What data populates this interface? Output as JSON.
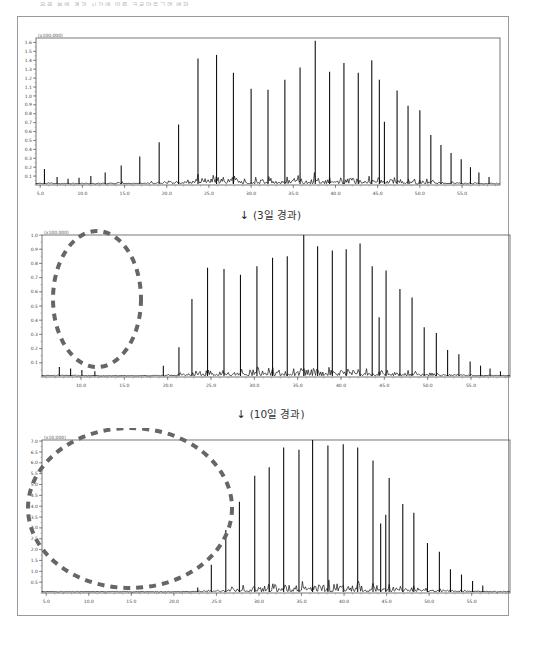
{
  "figure": {
    "top_caption": "유류 분해 경과 시간에 따른 크로마토그램 변화",
    "separators": [
      {
        "arrow_icon": "↓",
        "label": "(3일 경과)"
      },
      {
        "arrow_icon": "↓",
        "label": "(10일 경과)"
      }
    ]
  },
  "chart_data": [
    {
      "type": "line",
      "title": "",
      "xlabel": "",
      "ylabel": "",
      "y_multiplier": "(x100,000)",
      "xlim": [
        4.5,
        59.5
      ],
      "ylim": [
        0,
        1.65
      ],
      "x_ticks": [
        "5.0",
        "10.0",
        "15.0",
        "20.0",
        "25.0",
        "30.0",
        "35.0",
        "40.0",
        "45.0",
        "50.0",
        "55.0"
      ],
      "y_ticks": [
        "0.1",
        "0.2",
        "0.3",
        "0.4",
        "0.5",
        "0.6",
        "0.7",
        "0.8",
        "0.9",
        "1.0",
        "1.1",
        "1.2",
        "1.3",
        "1.4",
        "1.5",
        "1.6"
      ],
      "grid": false,
      "annotation": null,
      "peaks": {
        "x": [
          5.5,
          7.0,
          8.3,
          9.6,
          11.0,
          12.7,
          14.6,
          16.8,
          19.1,
          21.4,
          23.7,
          25.9,
          27.9,
          30.0,
          32.0,
          34.0,
          35.8,
          37.6,
          39.3,
          41.0,
          42.7,
          44.3,
          45.2,
          45.8,
          47.3,
          48.6,
          50.0,
          51.3,
          52.5,
          53.7,
          54.9,
          56.0,
          57.0,
          58.2
        ],
        "y": [
          0.18,
          0.09,
          0.07,
          0.08,
          0.1,
          0.14,
          0.22,
          0.32,
          0.48,
          0.68,
          1.42,
          1.46,
          1.26,
          1.08,
          1.07,
          1.18,
          1.32,
          1.62,
          1.27,
          1.37,
          1.26,
          1.4,
          1.18,
          0.71,
          1.06,
          0.89,
          0.84,
          0.56,
          0.45,
          0.36,
          0.29,
          0.2,
          0.14,
          0.09
        ]
      }
    },
    {
      "type": "line",
      "title": "",
      "xlabel": "",
      "ylabel": "",
      "y_multiplier": "(x100,000)",
      "xlim": [
        5.5,
        59.5
      ],
      "ylim": [
        0,
        1.0
      ],
      "x_ticks": [
        "10.0",
        "15.0",
        "20.0",
        "25.0",
        "30.0",
        "35.0",
        "40.0",
        "45.0",
        "50.0",
        "55.0"
      ],
      "y_ticks": [
        "0.1",
        "0.2",
        "0.3",
        "0.4",
        "0.5",
        "0.6",
        "0.7",
        "0.8",
        "0.9",
        "1.0"
      ],
      "grid": false,
      "annotation": "dashed ellipse marking disappearance of light fraction peaks (≈7–22 min)",
      "peaks": {
        "x": [
          7.5,
          8.8,
          10.1,
          11.6,
          19.5,
          21.3,
          22.8,
          24.6,
          26.5,
          28.4,
          30.3,
          32.1,
          33.8,
          35.7,
          37.3,
          39.0,
          40.6,
          42.2,
          43.6,
          44.4,
          45.2,
          46.8,
          48.2,
          49.6,
          51.0,
          52.3,
          53.6,
          54.9,
          56.1,
          57.2,
          58.4
        ],
        "y": [
          0.07,
          0.06,
          0.05,
          0.04,
          0.08,
          0.21,
          0.55,
          0.77,
          0.76,
          0.72,
          0.78,
          0.84,
          0.85,
          1.0,
          0.92,
          0.89,
          0.9,
          0.94,
          0.78,
          0.42,
          0.75,
          0.62,
          0.56,
          0.35,
          0.31,
          0.19,
          0.16,
          0.11,
          0.08,
          0.06,
          0.04
        ]
      }
    },
    {
      "type": "line",
      "title": "",
      "xlabel": "",
      "ylabel": "",
      "y_multiplier": "(x10,000)",
      "xlim": [
        4.5,
        59.5
      ],
      "ylim": [
        0,
        7.05
      ],
      "x_ticks": [
        "5.0",
        "10.0",
        "15.0",
        "20.0",
        "25.0",
        "30.0",
        "35.0",
        "40.0",
        "45.0",
        "50.0",
        "55.0"
      ],
      "y_ticks": [
        "0.5",
        "1.0",
        "1.5",
        "2.0",
        "2.5",
        "3.0",
        "3.5",
        "4.0",
        "4.5",
        "5.0",
        "5.5",
        "6.0",
        "6.5",
        "7.0"
      ],
      "grid": false,
      "annotation": "dashed ellipse marking further loss of light and mid fraction peaks (≈5–30 min)",
      "peaks": {
        "x": [
          8.5,
          11.8,
          22.8,
          24.4,
          26.1,
          27.7,
          29.5,
          31.2,
          32.9,
          34.7,
          36.3,
          38.1,
          39.9,
          41.6,
          43.4,
          44.3,
          44.9,
          45.3,
          46.9,
          48.2,
          49.8,
          51.2,
          52.5,
          53.8,
          55.1,
          56.3
        ],
        "y": [
          0.05,
          0.04,
          0.25,
          1.3,
          2.9,
          4.2,
          5.4,
          5.8,
          6.7,
          6.6,
          7.05,
          6.8,
          6.85,
          6.7,
          6.1,
          3.2,
          3.6,
          5.3,
          4.1,
          3.7,
          2.3,
          1.9,
          1.1,
          0.85,
          0.55,
          0.35
        ]
      }
    }
  ]
}
